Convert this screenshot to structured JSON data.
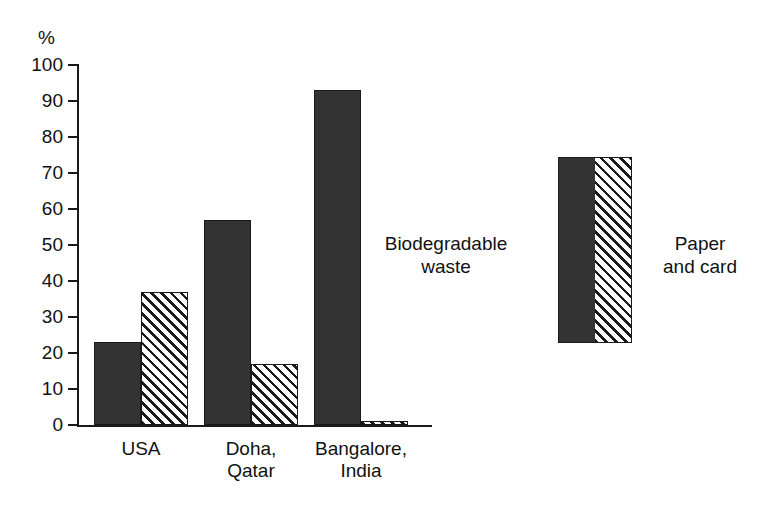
{
  "chart_data": {
    "type": "bar",
    "title": "",
    "subtitle": "",
    "xlabel": "",
    "ylabel": "%",
    "ylim": [
      0,
      100
    ],
    "yticks": [
      0,
      10,
      20,
      30,
      40,
      50,
      60,
      70,
      80,
      90,
      100
    ],
    "ytick_labels": [
      "0",
      "10",
      "20",
      "30",
      "40",
      "50",
      "60",
      "70",
      "80",
      "90",
      "100"
    ],
    "grid": false,
    "legend_position": "right",
    "categories": [
      "USA",
      "Doha, Qatar",
      "Bangalore, India"
    ],
    "category_lines": [
      [
        "USA"
      ],
      [
        "Doha,",
        "Qatar"
      ],
      [
        "Bangalore,",
        "India"
      ]
    ],
    "series": [
      {
        "name": "Biodegradable waste",
        "name_lines": [
          "Biodegradable",
          "waste"
        ],
        "fill": "solid",
        "color": "#333333",
        "values": [
          23,
          57,
          93
        ]
      },
      {
        "name": "Paper and card",
        "name_lines": [
          "Paper",
          "and card"
        ],
        "fill": "hatch",
        "color": "#ffffff",
        "values": [
          37,
          17,
          1
        ]
      }
    ],
    "annotations": []
  },
  "colors": {
    "solid_fill": "#333333",
    "hatch_fill": "#ffffff",
    "outline": "#1a1a1a",
    "text": "#111111",
    "background": "#ffffff"
  },
  "axis": {
    "unit_label": "%"
  }
}
